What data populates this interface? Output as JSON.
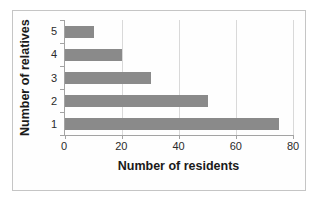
{
  "chart_data": {
    "type": "bar",
    "orientation": "horizontal",
    "title": "",
    "xlabel": "Number of residents",
    "ylabel": "Number of relatives",
    "categories": [
      "5",
      "4",
      "3",
      "2",
      "1"
    ],
    "values": [
      10,
      20,
      30,
      50,
      75
    ],
    "xlim": [
      0,
      80
    ],
    "xticks": [
      0,
      20,
      40,
      60,
      80
    ],
    "grid": "vertical",
    "legend": "none",
    "bar_color": "#8a8a8a",
    "gridline_color": "#d9d9d9",
    "axis_color": "#a3a3a3",
    "text_color": "#2b2b2b",
    "frame_border_color": "#c5c5c5"
  }
}
